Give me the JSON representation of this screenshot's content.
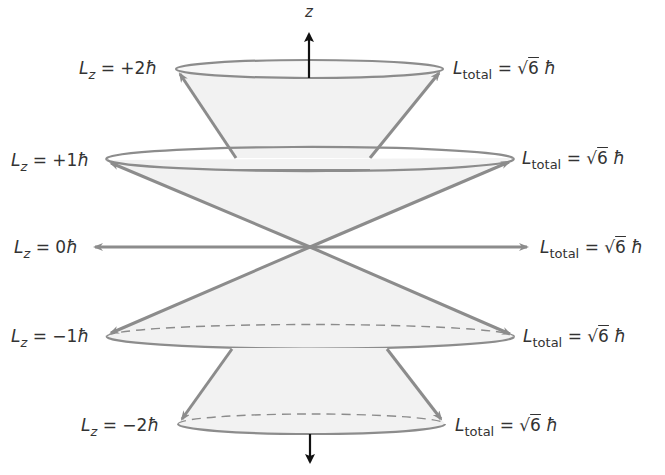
{
  "diagram": {
    "type": "angular-momentum-vector-model",
    "axis": {
      "label": "z"
    },
    "colors": {
      "cone_fill": "#f2f2f2",
      "outline": "#8c8c8c",
      "vector": "#8c8c8c",
      "axis": "#111111",
      "text": "#333333"
    },
    "levels": [
      {
        "lz_symbol": "L",
        "lz_sub": "z",
        "lz_value": "= +2",
        "hbar": "ħ",
        "total_symbol": "L",
        "total_sub": "total",
        "total_eq": "= √",
        "total_rad": "6",
        "total_hbar": "ħ"
      },
      {
        "lz_symbol": "L",
        "lz_sub": "z",
        "lz_value": "= +1",
        "hbar": "ħ",
        "total_symbol": "L",
        "total_sub": "total",
        "total_eq": "= √",
        "total_rad": "6",
        "total_hbar": "ħ"
      },
      {
        "lz_symbol": "L",
        "lz_sub": "z",
        "lz_value": "= 0",
        "hbar": "ħ",
        "total_symbol": "L",
        "total_sub": "total",
        "total_eq": "= √",
        "total_rad": "6",
        "total_hbar": "ħ"
      },
      {
        "lz_symbol": "L",
        "lz_sub": "z",
        "lz_value": "= −1",
        "hbar": "ħ",
        "total_symbol": "L",
        "total_sub": "total",
        "total_eq": "= √",
        "total_rad": "6",
        "total_hbar": "ħ"
      },
      {
        "lz_symbol": "L",
        "lz_sub": "z",
        "lz_value": "= −2",
        "hbar": "ħ",
        "total_symbol": "L",
        "total_sub": "total",
        "total_eq": "= √",
        "total_rad": "6",
        "total_hbar": "ħ"
      }
    ]
  }
}
